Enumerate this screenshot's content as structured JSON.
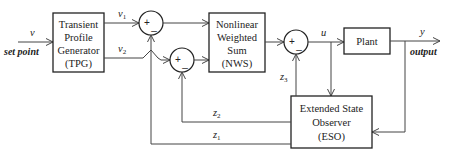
{
  "diagram": {
    "blocks": {
      "tpg": {
        "lines": [
          "Transient",
          "Profile",
          "Generator",
          "(TPG)"
        ]
      },
      "nws": {
        "lines": [
          "Nonlinear",
          "Weighted",
          "Sum",
          "(NWS)"
        ]
      },
      "plant": {
        "lines": [
          "Plant"
        ]
      },
      "eso": {
        "lines": [
          "Extended State",
          "Observer",
          "(ESO)"
        ]
      }
    },
    "summers": {
      "s1": {
        "plus": "+",
        "minus": "_"
      },
      "s2": {
        "plus": "+",
        "minus": "_"
      },
      "s3": {
        "plus": "+",
        "minus": "_"
      }
    },
    "signals": {
      "v": "v",
      "v1": {
        "base": "v",
        "sub": "1"
      },
      "v2": {
        "base": "v",
        "sub": "2"
      },
      "u": "u",
      "y": "y",
      "z1": {
        "base": "z",
        "sub": "1"
      },
      "z2": {
        "base": "z",
        "sub": "2"
      },
      "z3": {
        "base": "z",
        "sub": "3"
      }
    },
    "annotations": {
      "input": "set point",
      "output": "output"
    },
    "colors": {
      "line": "#444444",
      "box_border": "#222222",
      "background": "#ffffff"
    }
  }
}
